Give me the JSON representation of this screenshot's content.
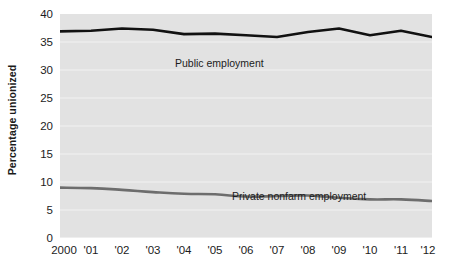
{
  "chart_data": {
    "type": "line",
    "title": "",
    "subtitle": "",
    "xlabel": "",
    "ylabel": "Percentage unionized",
    "x": [
      2000,
      2001,
      2002,
      2003,
      2004,
      2005,
      2006,
      2007,
      2008,
      2009,
      2010,
      2011,
      2012
    ],
    "xtick_labels": [
      "2000",
      "'01",
      "'02",
      "'03",
      "'04",
      "'05",
      "'06",
      "'07",
      "'08",
      "'09",
      "'10",
      "'11",
      "'12"
    ],
    "ytick_labels": [
      "0",
      "5",
      "10",
      "15",
      "20",
      "25",
      "30",
      "35",
      "40"
    ],
    "ytick_values": [
      0,
      5,
      10,
      15,
      20,
      25,
      30,
      35,
      40
    ],
    "ylim": [
      0,
      40
    ],
    "xlim": [
      2000,
      2012
    ],
    "grid": true,
    "grid_color": "#f2f2f2",
    "plot_background": "#e2e2e2",
    "legend": "inline-labels",
    "legend_position": "inline",
    "series": [
      {
        "name": "Public employment",
        "label": "Public employment",
        "color": "#111111",
        "line_width": 2.6,
        "values": [
          36.9,
          37.0,
          37.4,
          37.2,
          36.4,
          36.5,
          36.2,
          35.9,
          36.8,
          37.4,
          36.2,
          37.0,
          35.9
        ]
      },
      {
        "name": "Private nonfarm employment",
        "label": "Private nonfarm employment",
        "color": "#6d6d6d",
        "line_width": 2.6,
        "values": [
          9.0,
          8.9,
          8.6,
          8.2,
          7.9,
          7.8,
          7.4,
          7.5,
          7.6,
          7.2,
          6.9,
          6.9,
          6.6
        ]
      }
    ]
  },
  "figure": {
    "name": "union-membership-line-chart"
  }
}
